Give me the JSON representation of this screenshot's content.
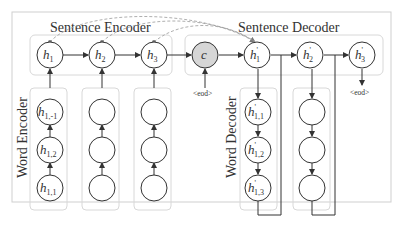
{
  "diagram": {
    "heading_cut": "",
    "groups": {
      "sentence_encoder": "Sentence Encoder",
      "sentence_decoder": "Sentence Decoder",
      "word_encoder": "Word Encoder",
      "word_decoder": "Word Decoder"
    },
    "sentence_nodes": [
      {
        "id": "h1",
        "base": "h",
        "sub": "1",
        "sup": ""
      },
      {
        "id": "h2",
        "base": "h",
        "sub": "2",
        "sup": ""
      },
      {
        "id": "h3",
        "base": "h",
        "sub": "3",
        "sup": ""
      },
      {
        "id": "c",
        "base": "c",
        "sub": "",
        "sup": ""
      },
      {
        "id": "h1p",
        "base": "h",
        "sub": "1",
        "sup": "'"
      },
      {
        "id": "h2p",
        "base": "h",
        "sub": "2",
        "sup": "'"
      },
      {
        "id": "h3p",
        "base": "h",
        "sub": "3",
        "sup": "'"
      }
    ],
    "word_encoder_nodes": [
      {
        "base": "h",
        "sub": "1,-1"
      },
      {
        "base": "h",
        "sub": "1,2"
      },
      {
        "base": "h",
        "sub": "1,1"
      }
    ],
    "word_decoder_nodes": [
      {
        "base": "h",
        "sub": "1,1",
        "sup": "'"
      },
      {
        "base": "h",
        "sub": "1,2",
        "sup": "'"
      },
      {
        "base": "h",
        "sub": "1,3",
        "sup": "'"
      }
    ],
    "eod_labels": [
      "<eod>",
      "<eod>"
    ],
    "colors": {
      "node_stroke": "#333333",
      "context_fill": "#d6d6d6",
      "group_border": "#d8d8d8",
      "dashed": "#9a9a9a"
    }
  }
}
